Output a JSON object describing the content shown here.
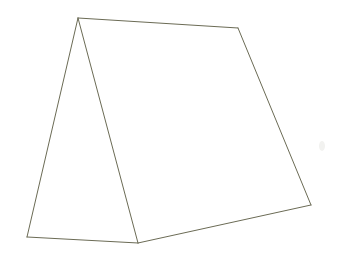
{
  "scene": {
    "title": "Tent line drawing",
    "description": "Hand-drawn outline of a tent (triangular prism) in three-quarter view",
    "background_color": "#ffffff",
    "canvas_width": 339,
    "canvas_height": 263
  },
  "style": {
    "stroke_color": "#6b6b55",
    "stroke_width": 1,
    "fill_color": "#ffffff",
    "smudge_color": "#f2f2f0"
  },
  "vertices": {
    "apex_front": {
      "label": "apex-front",
      "x": 78,
      "y": 18
    },
    "apex_back": {
      "label": "apex-back",
      "x": 238,
      "y": 28
    },
    "base_front_left": {
      "label": "base-front-left",
      "x": 27,
      "y": 237
    },
    "base_front_right": {
      "label": "base-front-right",
      "x": 138,
      "y": 243
    },
    "base_back_right": {
      "label": "base-back-right",
      "x": 311,
      "y": 205
    }
  },
  "faces": [
    {
      "name": "front-triangle-face",
      "points": "78,18 27,237 138,243",
      "fill": "#ffffff"
    },
    {
      "name": "side-quad-face",
      "points": "78,18 238,28 311,205 138,243",
      "fill": "#ffffff"
    }
  ],
  "edges": [
    {
      "name": "ridge-edge",
      "from": "apex_front",
      "to": "apex_back",
      "d": "M 78 18 L 238 28"
    },
    {
      "name": "back-slope-edge",
      "from": "apex_back",
      "to": "base_back_right",
      "d": "M 238 28 L 311 205"
    },
    {
      "name": "base-back-edge",
      "from": "base_back_right",
      "to": "base_front_right",
      "d": "M 311 205 L 138 243"
    },
    {
      "name": "front-right-slope-edge",
      "from": "apex_front",
      "to": "base_front_right",
      "d": "M 78 18 L 138 243"
    },
    {
      "name": "front-left-slope-edge",
      "from": "apex_front",
      "to": "base_front_left",
      "d": "M 78 18 L 27 237"
    },
    {
      "name": "base-front-edge",
      "from": "base_front_left",
      "to": "base_front_right",
      "d": "M 27 237 L 138 243"
    }
  ],
  "artifacts": [
    {
      "name": "paper-smudge",
      "cx": 322,
      "cy": 146,
      "rx": 3,
      "ry": 5
    }
  ]
}
